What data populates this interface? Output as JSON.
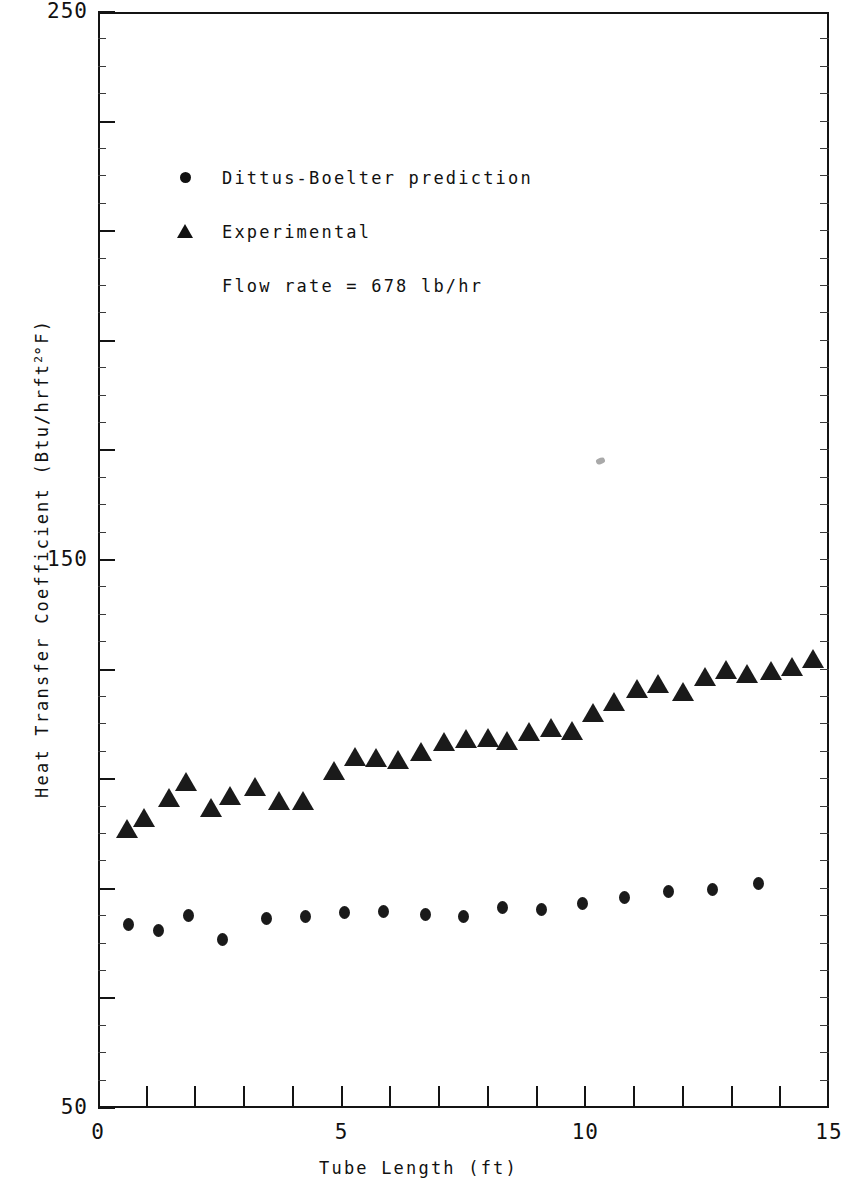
{
  "chart_data": {
    "type": "scatter",
    "title": "",
    "xlabel": "Tube Length (ft)",
    "ylabel": "Heat Transfer Coefficient (Btu/hrft2°F)",
    "ylabel_parts": {
      "pre": "Heat Transfer Coefficient  (Btu/hrft",
      "sup": "2",
      "post": "°F)"
    },
    "xlim": [
      0,
      15
    ],
    "ylim": [
      50,
      250
    ],
    "x_ticks_labeled": [
      "0",
      "5",
      "10",
      "15"
    ],
    "x_ticks_labeled_values": [
      0,
      5,
      10,
      15
    ],
    "x_ticks_minor_values": [
      1,
      2,
      3,
      4,
      6,
      7,
      8,
      9,
      11,
      12,
      13,
      14
    ],
    "y_ticks_labeled": [
      "250",
      "150",
      "50"
    ],
    "y_ticks_labeled_values": [
      250,
      150,
      50
    ],
    "y_ticks_major_values": [
      230,
      210,
      190,
      170,
      130,
      110,
      90,
      70
    ],
    "grid": false,
    "legend_position": "upper-left",
    "annotation": "Flow rate = 678 lb/hr",
    "series": [
      {
        "name": "Dittus-Boelter prediction",
        "marker": "circle",
        "color": "#1a1a1a",
        "points": [
          {
            "x": 0.62,
            "y": 83.5
          },
          {
            "x": 1.25,
            "y": 82.3
          },
          {
            "x": 1.85,
            "y": 85.2
          },
          {
            "x": 2.55,
            "y": 80.8
          },
          {
            "x": 3.45,
            "y": 84.6
          },
          {
            "x": 4.25,
            "y": 85.0
          },
          {
            "x": 5.05,
            "y": 85.6
          },
          {
            "x": 5.85,
            "y": 85.8
          },
          {
            "x": 6.72,
            "y": 85.4
          },
          {
            "x": 7.5,
            "y": 84.9
          },
          {
            "x": 8.3,
            "y": 86.6
          },
          {
            "x": 9.1,
            "y": 86.2
          },
          {
            "x": 9.95,
            "y": 87.3
          },
          {
            "x": 10.8,
            "y": 88.4
          },
          {
            "x": 11.7,
            "y": 89.5
          },
          {
            "x": 12.6,
            "y": 89.9
          },
          {
            "x": 13.55,
            "y": 91.0
          }
        ]
      },
      {
        "name": "Experimental",
        "marker": "triangle",
        "color": "#1a1a1a",
        "points": [
          {
            "x": 0.6,
            "y": 101.0
          },
          {
            "x": 0.95,
            "y": 103.0
          },
          {
            "x": 1.45,
            "y": 106.5
          },
          {
            "x": 1.8,
            "y": 109.5
          },
          {
            "x": 2.32,
            "y": 104.8
          },
          {
            "x": 2.7,
            "y": 107.0
          },
          {
            "x": 3.22,
            "y": 108.6
          },
          {
            "x": 3.72,
            "y": 106.0
          },
          {
            "x": 4.2,
            "y": 106.0
          },
          {
            "x": 4.85,
            "y": 111.5
          },
          {
            "x": 5.28,
            "y": 114.0
          },
          {
            "x": 5.7,
            "y": 113.8
          },
          {
            "x": 6.15,
            "y": 113.5
          },
          {
            "x": 6.62,
            "y": 115.0
          },
          {
            "x": 7.1,
            "y": 116.8
          },
          {
            "x": 7.55,
            "y": 117.4
          },
          {
            "x": 8.0,
            "y": 117.5
          },
          {
            "x": 8.4,
            "y": 117.0
          },
          {
            "x": 8.85,
            "y": 118.6
          },
          {
            "x": 9.3,
            "y": 119.4
          },
          {
            "x": 9.72,
            "y": 118.8
          },
          {
            "x": 10.15,
            "y": 122.0
          },
          {
            "x": 10.58,
            "y": 124.0
          },
          {
            "x": 11.05,
            "y": 126.5
          },
          {
            "x": 11.5,
            "y": 127.3
          },
          {
            "x": 12.0,
            "y": 126.0
          },
          {
            "x": 12.45,
            "y": 128.6
          },
          {
            "x": 12.88,
            "y": 130.0
          },
          {
            "x": 13.32,
            "y": 129.2
          },
          {
            "x": 13.8,
            "y": 129.8
          },
          {
            "x": 14.25,
            "y": 130.4
          },
          {
            "x": 14.68,
            "y": 132.0
          }
        ]
      }
    ]
  },
  "legend": {
    "entries": [
      {
        "label": "Dittus-Boelter prediction",
        "marker": "circle"
      },
      {
        "label": "Experimental",
        "marker": "triangle"
      }
    ],
    "note": "Flow rate = 678 lb/hr"
  }
}
